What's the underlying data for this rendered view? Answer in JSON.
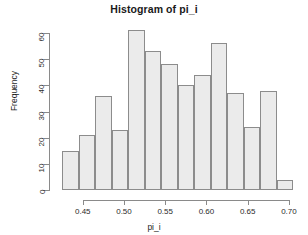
{
  "chart_data": {
    "type": "bar",
    "title": "Histogram of pi_i",
    "xlabel": "pi_i",
    "ylabel": "Frequency",
    "grid": false,
    "legend": null,
    "xlim": [
      0.4212,
      0.7037
    ],
    "ylim": [
      0,
      60.5
    ],
    "bin_width": 0.02,
    "bin_edges": [
      0.425,
      0.445,
      0.465,
      0.485,
      0.505,
      0.525,
      0.545,
      0.565,
      0.585,
      0.605,
      0.625,
      0.645,
      0.665,
      0.685,
      0.705
    ],
    "categories": [
      "0.425-0.445",
      "0.445-0.465",
      "0.465-0.485",
      "0.485-0.505",
      "0.505-0.525",
      "0.525-0.545",
      "0.545-0.565",
      "0.565-0.585",
      "0.585-0.605",
      "0.605-0.625",
      "0.625-0.645",
      "0.645-0.665",
      "0.665-0.685",
      "0.685-0.705"
    ],
    "values": [
      15,
      21,
      36,
      23,
      61,
      53,
      48,
      40,
      44,
      56,
      37,
      24,
      38,
      4
    ],
    "xticks": [
      0.45,
      0.5,
      0.55,
      0.6,
      0.65,
      0.7
    ],
    "xtick_labels": [
      "0.45",
      "0.50",
      "0.55",
      "0.60",
      "0.65",
      "0.70"
    ],
    "yticks": [
      0,
      10,
      20,
      30,
      40,
      50,
      60
    ],
    "ytick_labels": [
      "0",
      "10",
      "20",
      "30",
      "40",
      "50",
      "60"
    ],
    "bar_fill_color": "#ebebeb",
    "bar_border_color": "#8c8c8c",
    "axis_color": "#8a8a8a",
    "text_color": "#1f1f1f",
    "background_color": "#ffffff"
  }
}
